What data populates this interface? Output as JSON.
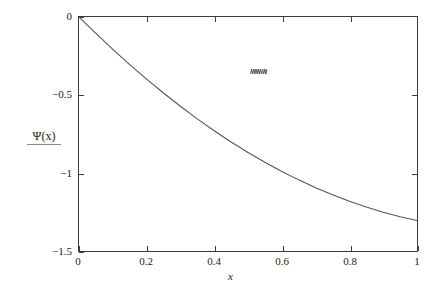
{
  "figure": {
    "background_color": "#ffffff",
    "axis_color": "#3c3c3c",
    "curve_color": "#555555"
  },
  "chart_data": {
    "type": "line",
    "title": "",
    "subtitle": "",
    "xlabel": "x",
    "ylabel": "Ψ(x)",
    "xlim": [
      0,
      1
    ],
    "ylim": [
      -1.5,
      0
    ],
    "grid": false,
    "legend": null,
    "xticks": [
      0,
      0.2,
      0.4,
      0.6,
      0.8,
      1
    ],
    "xticklabels": [
      "0",
      "0.2",
      "0.4",
      "0.6",
      "0.8",
      "1"
    ],
    "yticks": [
      -1.5,
      -1,
      -0.5,
      0
    ],
    "yticklabels": [
      "−1.5",
      "−1",
      "−0.5",
      "0"
    ],
    "series": [
      {
        "name": "Ψ(x)",
        "color": "#555555",
        "linewidth": 1,
        "x": [
          0.0,
          0.05,
          0.1,
          0.15,
          0.2,
          0.25,
          0.3,
          0.35,
          0.4,
          0.45,
          0.5,
          0.55,
          0.6,
          0.65,
          0.7,
          0.75,
          0.8,
          0.85,
          0.9,
          0.95,
          1.0
        ],
        "y": [
          0.0,
          -0.105,
          -0.207,
          -0.305,
          -0.398,
          -0.487,
          -0.572,
          -0.653,
          -0.729,
          -0.801,
          -0.868,
          -0.931,
          -0.99,
          -1.044,
          -1.094,
          -1.14,
          -1.181,
          -1.218,
          -1.251,
          -1.28,
          -1.305
        ]
      }
    ],
    "annotations": [
      {
        "name": "squiggle-mark",
        "text": "∿∿",
        "x": 0.29,
        "y": -0.215
      }
    ]
  },
  "axis_labels": {
    "x_title": "x",
    "y_title": "Ψ(x)"
  }
}
